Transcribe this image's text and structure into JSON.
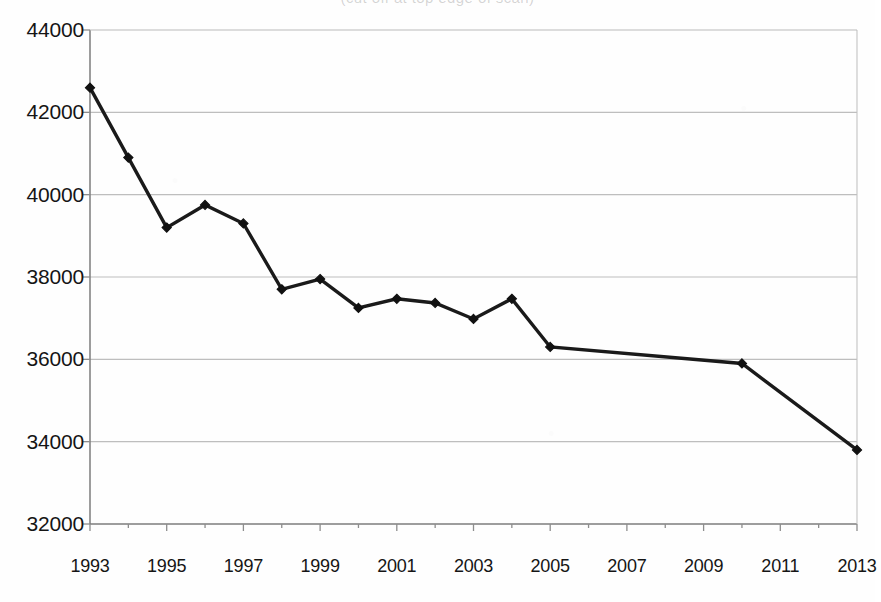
{
  "title_strip": {
    "text": "(cut off at top edge of scan)",
    "legible": false
  },
  "axes": {
    "y_ticks": [
      "44000",
      "42000",
      "40000",
      "38000",
      "36000",
      "34000",
      "32000"
    ],
    "x_ticks": [
      "1993",
      "1995",
      "1997",
      "1999",
      "2001",
      "2003",
      "2005",
      "2007",
      "2009",
      "2011",
      "2013"
    ]
  },
  "colors": {
    "line": "#1a1a1a",
    "marker": "#111111",
    "gridline": "#b9b9b9",
    "axis": "#8d8d8d",
    "frame": "#c2c2c2",
    "background": "#fefefe",
    "text": "#151515"
  },
  "chart_data": {
    "type": "line",
    "title": "",
    "xlabel": "",
    "ylabel": "",
    "xlim": [
      1993,
      2013
    ],
    "ylim": [
      32000,
      44000
    ],
    "ytick_step": 2000,
    "xtick_step": 2,
    "grid": true,
    "legend": false,
    "marker": "diamond",
    "x": [
      1993,
      1994,
      1995,
      1996,
      1997,
      1998,
      1999,
      2000,
      2001,
      2002,
      2003,
      2004,
      2005,
      2010,
      2013
    ],
    "values": [
      42600,
      40900,
      39200,
      39750,
      39300,
      37700,
      37950,
      37250,
      37470,
      37370,
      36980,
      37470,
      36300,
      35900,
      33800
    ],
    "series": [
      {
        "name": "series-1",
        "x": [
          1993,
          1994,
          1995,
          1996,
          1997,
          1998,
          1999,
          2000,
          2001,
          2002,
          2003,
          2004,
          2005,
          2010,
          2013
        ],
        "values": [
          42600,
          40900,
          39200,
          39750,
          39300,
          37700,
          37950,
          37250,
          37470,
          37370,
          36980,
          37470,
          36300,
          35900,
          33800
        ]
      }
    ]
  }
}
